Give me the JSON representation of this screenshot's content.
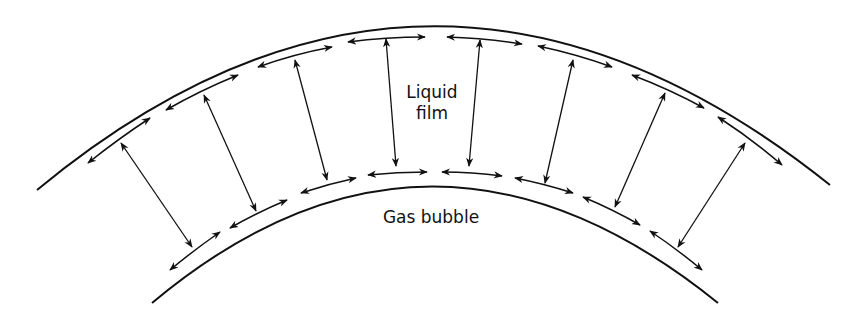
{
  "labels": {
    "liquid_film_line1": "Liquid",
    "liquid_film_line2": "film",
    "gas_bubble": "Gas bubble"
  },
  "colors": {
    "stroke": "#111111",
    "background": "#ffffff"
  },
  "diagram": {
    "outer_surface_arrows": 8,
    "inner_surface_arrows": 8,
    "radial_arrows": 8
  }
}
